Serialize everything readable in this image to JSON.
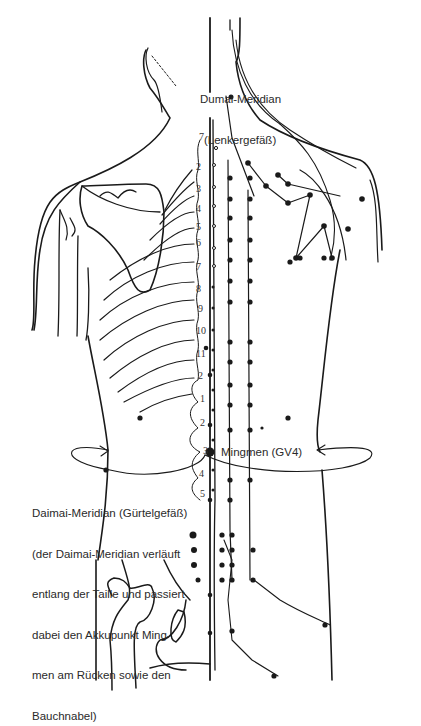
{
  "labels": {
    "dumai_line1": "Dumai-Meridian",
    "dumai_line2": "(Lenkergefäß)",
    "mingmen": "Mingmen (GV4)",
    "daimai_line1": "Daimai-Meridian (Gürtelgefäß)",
    "daimai_line2": "(der Daimai-Meridian verläuft",
    "daimai_line3": "entlang der Taille und passiert",
    "daimai_line4": "dabei den Akkupunkt Ming-",
    "daimai_line5": "men am Rücken sowie den",
    "daimai_line6": "Bauchnabel)"
  },
  "vertebrae": {
    "cervical": [
      "7"
    ],
    "thoracic": [
      "1",
      "2",
      "3",
      "4",
      "5",
      "6",
      "7",
      "8",
      "9",
      "10",
      "11",
      "12"
    ],
    "lumbar": [
      "1",
      "2",
      "3",
      "4",
      "5"
    ]
  },
  "vertebra_labels": [
    {
      "text": "7",
      "x": 199,
      "y": 138
    },
    {
      "text": "2",
      "x": 196,
      "y": 168
    },
    {
      "text": "3",
      "x": 196,
      "y": 190
    },
    {
      "text": "4",
      "x": 196,
      "y": 210
    },
    {
      "text": "5",
      "x": 196,
      "y": 228
    },
    {
      "text": "6",
      "x": 196,
      "y": 243
    },
    {
      "text": "7",
      "x": 196,
      "y": 268
    },
    {
      "text": "8",
      "x": 196,
      "y": 290
    },
    {
      "text": "9",
      "x": 198,
      "y": 310
    },
    {
      "text": "10",
      "x": 199,
      "y": 332
    },
    {
      "text": "11",
      "x": 199,
      "y": 355
    },
    {
      "text": "2",
      "x": 198,
      "y": 377
    },
    {
      "text": "1",
      "x": 200,
      "y": 400
    },
    {
      "text": "2",
      "x": 200,
      "y": 424
    },
    {
      "text": "3",
      "x": 203,
      "y": 452
    },
    {
      "text": "4",
      "x": 199,
      "y": 475
    },
    {
      "text": "5",
      "x": 200,
      "y": 495
    }
  ],
  "colors": {
    "line": "#1a1a1a",
    "text": "#2a2a2a",
    "background": "#ffffff"
  }
}
